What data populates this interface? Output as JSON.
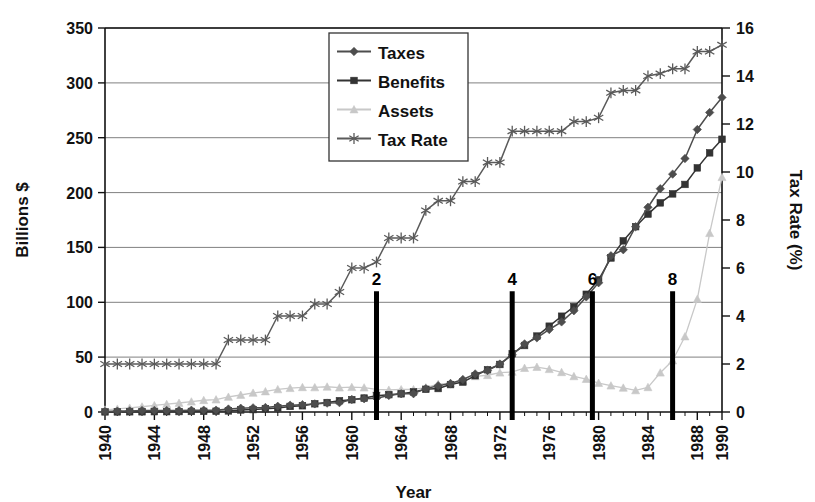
{
  "chart_data": {
    "type": "line",
    "title": "",
    "xlabel": "Year",
    "ylabel": "Billions $",
    "y2label": "Tax Rate (%)",
    "xlim": [
      1940,
      1990
    ],
    "ylim": [
      0,
      350
    ],
    "y2lim": [
      0,
      16
    ],
    "grid": true,
    "legend_position": "top-center",
    "xticks": [
      1940,
      1944,
      1948,
      1952,
      1956,
      1960,
      1964,
      1968,
      1972,
      1976,
      1980,
      1984,
      1988,
      1990
    ],
    "xtick_labels": [
      "1940",
      "1944",
      "1948",
      "1952",
      "1956",
      "1960",
      "1964",
      "1968",
      "1972",
      "1976",
      "1980",
      "1984",
      "1988",
      "1990"
    ],
    "yticks": [
      0,
      50,
      100,
      150,
      200,
      250,
      300,
      350
    ],
    "ytick_labels": [
      "0",
      "50",
      "100",
      "150",
      "200",
      "250",
      "300",
      "350"
    ],
    "y2ticks": [
      0,
      2,
      4,
      6,
      8,
      10,
      12,
      14,
      16
    ],
    "y2tick_labels": [
      "0",
      "2",
      "4",
      "6",
      "8",
      "10",
      "12",
      "14",
      "16"
    ],
    "x": [
      1940,
      1941,
      1942,
      1943,
      1944,
      1945,
      1946,
      1947,
      1948,
      1949,
      1950,
      1951,
      1952,
      1953,
      1954,
      1955,
      1956,
      1957,
      1958,
      1959,
      1960,
      1961,
      1962,
      1963,
      1964,
      1965,
      1966,
      1967,
      1968,
      1969,
      1970,
      1971,
      1972,
      1973,
      1974,
      1975,
      1976,
      1977,
      1978,
      1979,
      1980,
      1981,
      1982,
      1983,
      1984,
      1985,
      1986,
      1987,
      1988,
      1989,
      1990
    ],
    "series": [
      {
        "name": "Taxes",
        "axis": "left",
        "marker": "diamond",
        "color": "#4d4d4d",
        "values": [
          0.4,
          0.8,
          1.0,
          1.3,
          1.4,
          1.4,
          1.3,
          1.6,
          1.7,
          1.7,
          2.7,
          3.4,
          3.8,
          4.1,
          5.2,
          6.2,
          6.7,
          7.4,
          8.1,
          8.5,
          11.4,
          12.1,
          12.6,
          15.1,
          16.6,
          16.7,
          21.3,
          24.0,
          26.0,
          29.6,
          34.7,
          37.8,
          43.7,
          52.1,
          62.1,
          67.6,
          75.2,
          82.1,
          92.3,
          104.9,
          117.8,
          142.4,
          147.9,
          168.9,
          186.6,
          203.5,
          216.8,
          231.0,
          257.5,
          273.0,
          286.7
        ]
      },
      {
        "name": "Benefits",
        "axis": "left",
        "marker": "square",
        "color": "#333333",
        "values": [
          0.1,
          0.1,
          0.2,
          0.2,
          0.3,
          0.3,
          0.4,
          0.5,
          0.6,
          0.7,
          1.0,
          1.9,
          2.2,
          3.0,
          3.7,
          5.1,
          5.7,
          7.5,
          8.6,
          10.3,
          11.2,
          12.7,
          14.9,
          15.8,
          16.6,
          18.3,
          20.7,
          21.4,
          25.0,
          27.3,
          33.1,
          38.5,
          43.3,
          53.1,
          60.6,
          69.2,
          78.2,
          87.3,
          96.0,
          107.3,
          120.5,
          140.4,
          156.0,
          168.9,
          180.4,
          190.6,
          198.8,
          207.4,
          222.5,
          236.2,
          248.6
        ]
      },
      {
        "name": "Assets",
        "axis": "left",
        "marker": "triangle",
        "color": "#c8c8c8",
        "values": [
          2.0,
          2.8,
          3.7,
          4.8,
          6.0,
          7.1,
          8.2,
          9.4,
          10.7,
          11.3,
          13.7,
          15.5,
          17.4,
          18.7,
          20.6,
          21.7,
          22.5,
          22.4,
          23.0,
          22.2,
          22.6,
          22.2,
          20.7,
          20.1,
          20.5,
          20.6,
          22.3,
          25.4,
          26.2,
          28.4,
          32.5,
          33.5,
          35.8,
          36.5,
          40.0,
          41.0,
          39.0,
          36.2,
          32.5,
          30.0,
          26.4,
          24.0,
          22.0,
          19.7,
          22.5,
          35.8,
          46.9,
          68.8,
          102.9,
          163.0,
          214.0
        ]
      },
      {
        "name": "Tax Rate",
        "axis": "right",
        "marker": "asterisk",
        "color": "#5a5a5a",
        "values": [
          2.0,
          2.0,
          2.0,
          2.0,
          2.0,
          2.0,
          2.0,
          2.0,
          2.0,
          2.0,
          3.0,
          3.0,
          3.0,
          3.0,
          4.0,
          4.0,
          4.0,
          4.5,
          4.5,
          5.0,
          6.0,
          6.0,
          6.25,
          7.25,
          7.25,
          7.25,
          8.4,
          8.8,
          8.8,
          9.6,
          9.6,
          10.4,
          10.4,
          11.7,
          11.7,
          11.7,
          11.7,
          11.7,
          12.1,
          12.1,
          12.26,
          13.3,
          13.4,
          13.4,
          14.0,
          14.1,
          14.3,
          14.3,
          15.02,
          15.02,
          15.3
        ]
      }
    ],
    "annotations": [
      {
        "label": "2",
        "x": 1962,
        "y_top": 110
      },
      {
        "label": "4",
        "x": 1973,
        "y_top": 110
      },
      {
        "label": "6",
        "x": 1979.5,
        "y_top": 110
      },
      {
        "label": "8",
        "x": 1986,
        "y_top": 110
      }
    ]
  },
  "legend": {
    "items": [
      {
        "label": "Taxes"
      },
      {
        "label": "Benefits"
      },
      {
        "label": "Assets"
      },
      {
        "label": "Tax Rate"
      }
    ]
  },
  "colors": {
    "taxes": "#4d4d4d",
    "benefits": "#333333",
    "assets": "#c8c8c8",
    "tax_rate": "#5a5a5a",
    "grid": "#808080",
    "axis": "#111111",
    "annotation": "#000000",
    "background": "#ffffff"
  }
}
